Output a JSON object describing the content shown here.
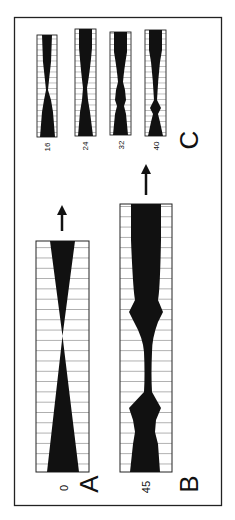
{
  "figure": {
    "orientation": "rotated 90 degrees counter-clockwise",
    "frame_color": "#222222",
    "ink_color": "#111111",
    "background": "#ffffff",
    "panels": [
      {
        "id": "A",
        "label": "A",
        "value_label": "0",
        "profile": "linear taper (hourglass)",
        "has_arrow": true
      },
      {
        "id": "B",
        "label": "B",
        "value_label": "45",
        "profile": "wide top with periodic bulges toward bottom",
        "has_arrow": true
      },
      {
        "id": "C",
        "label": "C",
        "strips": [
          {
            "value_label": "16"
          },
          {
            "value_label": "24"
          },
          {
            "value_label": "32"
          },
          {
            "value_label": "40"
          }
        ]
      }
    ]
  }
}
